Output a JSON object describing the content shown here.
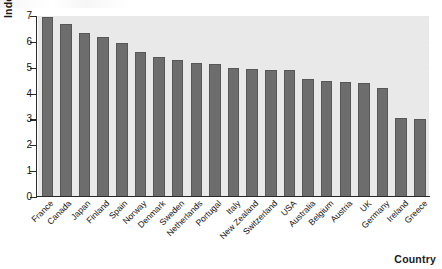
{
  "chart_data": {
    "type": "bar",
    "title": "",
    "xlabel": "Country",
    "ylabel": "Index",
    "ylim": [
      0,
      7
    ],
    "yticks": [
      0,
      1,
      2,
      3,
      4,
      5,
      6,
      7
    ],
    "grid": true,
    "legend": null,
    "orientation": "vertical",
    "categories": [
      "France",
      "Canada",
      "Japan",
      "Finland",
      "Spain",
      "Norway",
      "Denmark",
      "Sweden",
      "Netherlands",
      "Portugal",
      "Italy",
      "New Zealand",
      "Switzerland",
      "USA",
      "Australia",
      "Belgium",
      "Austria",
      "UK",
      "Germany",
      "Ireland",
      "Greece"
    ],
    "values": [
      6.95,
      6.7,
      6.35,
      6.2,
      5.95,
      5.6,
      5.4,
      5.3,
      5.2,
      5.15,
      5.0,
      4.95,
      4.9,
      4.9,
      4.55,
      4.5,
      4.45,
      4.4,
      4.2,
      3.05,
      3.0
    ],
    "bar_color": "#6d6d6d",
    "plot_background": "#e9e9e9",
    "axis_color": "#2a2a2a"
  },
  "axes": {
    "y_title": "Index",
    "x_title": "Country"
  }
}
